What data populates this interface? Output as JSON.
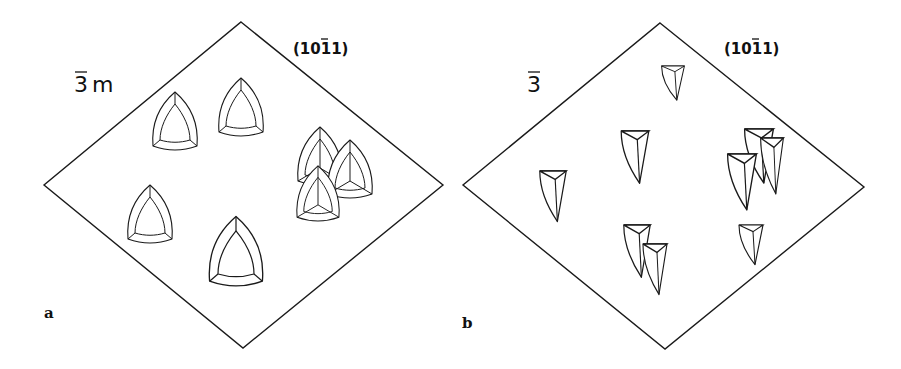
{
  "figure": {
    "panels": [
      {
        "id": "a",
        "panel_label": "a",
        "symmetry": {
          "digit": "3",
          "suffix": "m",
          "overbar": true,
          "text": "3̄m"
        },
        "face_label": {
          "text": "(10ī1)",
          "parts": [
            "(10",
            "1",
            "1)"
          ],
          "overbar_index": 1
        },
        "pit_shape": "curved-trigonal",
        "pit_count": 8
      },
      {
        "id": "b",
        "panel_label": "b",
        "symmetry": {
          "digit": "3",
          "suffix": "",
          "overbar": true,
          "text": "3̄"
        },
        "face_label": {
          "text": "(10ī1)",
          "parts": [
            "(10",
            "1",
            "1)"
          ],
          "overbar_index": 1
        },
        "pit_shape": "elongated-asymmetric-trigonal",
        "pit_count": 10
      }
    ]
  }
}
